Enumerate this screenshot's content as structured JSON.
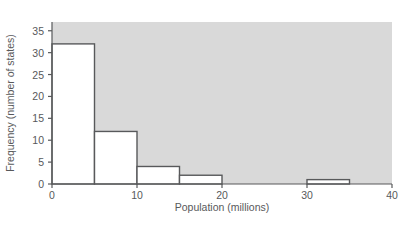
{
  "chart_data": {
    "type": "bar",
    "title": "",
    "subtitle": "",
    "xlabel": "Population (millions)",
    "ylabel": "Frequency (number of states)",
    "xlim": [
      0,
      40
    ],
    "ylim": [
      0,
      37
    ],
    "xticks": [
      "0",
      "10",
      "20",
      "30",
      "40"
    ],
    "xtick_values": [
      0,
      10,
      20,
      30,
      40
    ],
    "yticks": [
      "0",
      "5",
      "10",
      "15",
      "20",
      "25",
      "30",
      "35"
    ],
    "ytick_values": [
      0,
      5,
      10,
      15,
      20,
      25,
      30,
      35
    ],
    "grid": false,
    "legend": "none",
    "bin_width": 5,
    "bin_edges": [
      0,
      5,
      10,
      15,
      20,
      25,
      30,
      35,
      40
    ],
    "categories": [
      "0-5",
      "5-10",
      "10-15",
      "15-20",
      "20-25",
      "25-30",
      "30-35",
      "35-40"
    ],
    "values": [
      32,
      12,
      4,
      2,
      0,
      0,
      1,
      0
    ],
    "bars": [
      {
        "x0": 0,
        "x1": 5,
        "value": 32
      },
      {
        "x0": 5,
        "x1": 10,
        "value": 12
      },
      {
        "x0": 10,
        "x1": 15,
        "value": 4
      },
      {
        "x0": 15,
        "x1": 20,
        "value": 2
      },
      {
        "x0": 20,
        "x1": 25,
        "value": 0
      },
      {
        "x0": 25,
        "x1": 30,
        "value": 0
      },
      {
        "x0": 30,
        "x1": 35,
        "value": 1
      },
      {
        "x0": 35,
        "x1": 40,
        "value": 0
      }
    ],
    "colors": {
      "plot_background": "#d9d9d9",
      "bar_fill": "#ffffff",
      "bar_stroke": "#58595b",
      "axis": "#58595b",
      "text": "#58595b",
      "figure_background": "#ffffff"
    }
  }
}
